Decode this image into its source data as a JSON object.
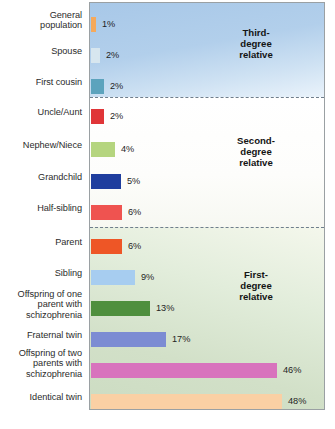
{
  "chart_data": {
    "type": "bar",
    "title": "",
    "xlabel": "",
    "ylabel": "",
    "orientation": "horizontal",
    "xlim": [
      0,
      53
    ],
    "grid": false,
    "value_suffix": "%",
    "categories": [
      "General\npopulation",
      "Spouse",
      "First cousin",
      "Uncle/Aunt",
      "Nephew/Niece",
      "Grandchild",
      "Half-sibling",
      "Parent",
      "Sibling",
      "Offspring of one\nparent with\nschizophrenia",
      "Fraternal twin",
      "Offspring of two\nparents with\nschizophrenia",
      "Identical twin"
    ],
    "values": [
      1,
      2,
      2,
      2,
      4,
      5,
      6,
      6,
      9,
      13,
      17,
      46,
      48
    ],
    "value_labels": [
      "1%",
      "2%",
      "2%",
      "2%",
      "4%",
      "5%",
      "6%",
      "6%",
      "9%",
      "13%",
      "17%",
      "46%",
      "48%"
    ],
    "bar_colors": [
      "#f5a95c",
      "#d7e6ef",
      "#5ca3bd",
      "#e03538",
      "#b5d57f",
      "#1f3e9e",
      "#ef5350",
      "#ee5626",
      "#a7cdf0",
      "#4f8f3e",
      "#7c8cd3",
      "#d873bd",
      "#fad0a4"
    ],
    "groups": [
      {
        "label": "Third-\ndegree\nrelative",
        "members": [
          "General population",
          "Spouse",
          "First cousin"
        ],
        "background": "#b2cfeb"
      },
      {
        "label": "Second-\ndegree\nrelative",
        "members": [
          "Uncle/Aunt",
          "Nephew/Niece",
          "Grandchild",
          "Half-sibling"
        ],
        "background": "#fdfdfb"
      },
      {
        "label": "First-\ndegree\nrelative",
        "members": [
          "Parent",
          "Sibling",
          "Offspring of one parent with schizophrenia",
          "Fraternal twin",
          "Offspring of two parents with schizophrenia",
          "Identical twin"
        ],
        "background": "#d8e6ce"
      }
    ],
    "axis_color": "#9aa0a3",
    "divider_style": "dashed"
  },
  "layout": {
    "rows": [
      {
        "bar_top": 14,
        "bar_width": 5,
        "label_top": 8,
        "value_left": 12
      },
      {
        "bar_top": 45,
        "bar_width": 9,
        "label_top": 44,
        "value_left": 16
      },
      {
        "bar_top": 76,
        "bar_width": 13,
        "label_top": 75,
        "value_left": 20
      },
      {
        "bar_top": 106,
        "bar_width": 13,
        "label_top": 105,
        "value_left": 20
      },
      {
        "bar_top": 139,
        "bar_width": 24,
        "label_top": 138,
        "value_left": 31
      },
      {
        "bar_top": 171,
        "bar_width": 30,
        "label_top": 170,
        "value_left": 37
      },
      {
        "bar_top": 202,
        "bar_width": 31,
        "label_top": 201,
        "value_left": 38
      },
      {
        "bar_top": 236,
        "bar_width": 31,
        "label_top": 235,
        "value_left": 38
      },
      {
        "bar_top": 267,
        "bar_width": 44,
        "label_top": 266,
        "value_left": 51
      },
      {
        "bar_top": 298,
        "bar_width": 59,
        "label_top": 287,
        "value_left": 66
      },
      {
        "bar_top": 329,
        "bar_width": 75,
        "label_top": 328,
        "value_left": 82
      },
      {
        "bar_top": 360,
        "bar_width": 186,
        "label_top": 346,
        "value_left": 193
      },
      {
        "bar_top": 391,
        "bar_width": 191,
        "label_top": 390,
        "value_left": 198
      }
    ]
  }
}
